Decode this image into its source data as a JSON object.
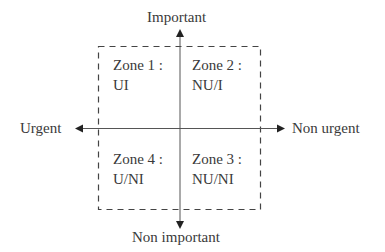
{
  "axes": {
    "top": "Important",
    "bottom": "Non important",
    "left": "Urgent",
    "right": "Non urgent"
  },
  "zones": [
    {
      "title": "Zone 1 :",
      "code": "UI"
    },
    {
      "title": "Zone 2 :",
      "code": "NU/I"
    },
    {
      "title": "Zone 3 :",
      "code": "NU/NI"
    },
    {
      "title": "Zone 4 :",
      "code": "U/NI"
    }
  ],
  "colors": {
    "line": "#444444",
    "text": "#3a3a3a",
    "background": "#ffffff"
  }
}
